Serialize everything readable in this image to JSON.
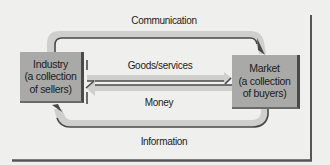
{
  "diagram": {
    "nodes": {
      "industry": {
        "line1": "Industry",
        "line2": "(a collection",
        "line3": "of sellers)"
      },
      "market": {
        "line1": "Market",
        "line2": "(a collection",
        "line3": "of buyers)"
      }
    },
    "flows": {
      "communication": "Communication",
      "goods_services": "Goods/services",
      "money": "Money",
      "information": "Information"
    },
    "colors": {
      "background": "#efefed",
      "box_fill": "#a9a9a7",
      "arrow_fill": "#cfcfcd",
      "arrow_edge": "#4a4a4a",
      "frame": "#555555"
    }
  }
}
